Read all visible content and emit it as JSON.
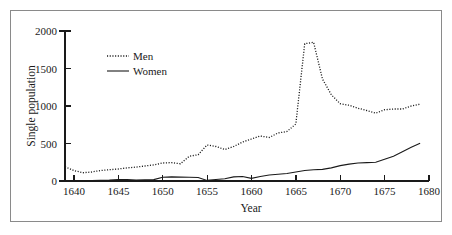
{
  "chart_data": {
    "type": "line",
    "title": "",
    "xlabel": "Year",
    "ylabel": "Single population",
    "xlim": [
      1639,
      1680
    ],
    "ylim": [
      0,
      2000
    ],
    "xticks": [
      1640,
      1645,
      1650,
      1655,
      1660,
      1665,
      1670,
      1675,
      1680
    ],
    "yticks": [
      0,
      500,
      1000,
      1500,
      2000
    ],
    "grid": false,
    "legend_position": "upper-left-inside",
    "legend": [
      "Men",
      "Women"
    ],
    "x": [
      1639,
      1640,
      1641,
      1642,
      1643,
      1644,
      1645,
      1646,
      1647,
      1648,
      1649,
      1650,
      1651,
      1652,
      1653,
      1654,
      1655,
      1656,
      1657,
      1658,
      1659,
      1660,
      1661,
      1662,
      1663,
      1664,
      1665,
      1666,
      1667,
      1668,
      1669,
      1670,
      1671,
      1672,
      1673,
      1674,
      1675,
      1676,
      1677,
      1678,
      1679
    ],
    "series": [
      {
        "name": "Men",
        "style": "dotted",
        "color": "#1a1a1a",
        "values": [
          190,
          140,
          110,
          120,
          140,
          150,
          160,
          175,
          185,
          200,
          215,
          240,
          245,
          230,
          330,
          350,
          480,
          460,
          420,
          460,
          520,
          560,
          600,
          580,
          640,
          660,
          760,
          1830,
          1850,
          1360,
          1150,
          1030,
          1010,
          970,
          940,
          905,
          950,
          960,
          960,
          1000,
          1025
        ]
      },
      {
        "name": "Women",
        "style": "solid",
        "color": "#1a1a1a",
        "values": [
          0,
          2,
          4,
          6,
          8,
          12,
          20,
          18,
          14,
          16,
          18,
          50,
          55,
          52,
          50,
          46,
          8,
          20,
          30,
          55,
          60,
          35,
          60,
          80,
          90,
          100,
          120,
          140,
          150,
          155,
          175,
          205,
          225,
          240,
          245,
          250,
          290,
          330,
          390,
          450,
          505
        ]
      }
    ]
  },
  "axis": {
    "y_tick_labels": [
      "2000",
      "1500",
      "1000",
      "500",
      "0"
    ],
    "x_tick_labels": [
      "1640",
      "1645",
      "1650",
      "1655",
      "1660",
      "1665",
      "1670",
      "1675",
      "1680"
    ],
    "x_title": "Year",
    "y_title": "Single population"
  },
  "legend": {
    "items": [
      {
        "label": "Men",
        "style": "dotted"
      },
      {
        "label": "Women",
        "style": "solid"
      }
    ]
  }
}
